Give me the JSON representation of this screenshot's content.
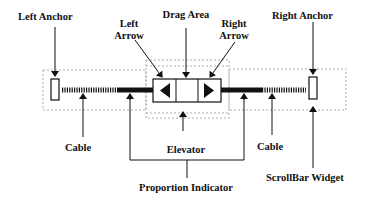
{
  "labels": {
    "left_anchor": "Left Anchor",
    "left_arrow_line1": "Left",
    "left_arrow_line2": "Arrow",
    "drag_area": "Drag Area",
    "right_arrow_line1": "Right",
    "right_arrow_line2": "Arrow",
    "right_anchor": "Right Anchor",
    "cable_left": "Cable",
    "elevator": "Elevator",
    "cable_right": "Cable",
    "scrollbar_widget": "ScrollBar Widget",
    "proportion_indicator": "Proportion Indicator"
  },
  "icons": {
    "left_arrow": "triangle-left",
    "right_arrow": "triangle-right"
  },
  "colors": {
    "ink": "#111111",
    "dotted_outline": "#9a9a9a",
    "background": "#ffffff"
  }
}
